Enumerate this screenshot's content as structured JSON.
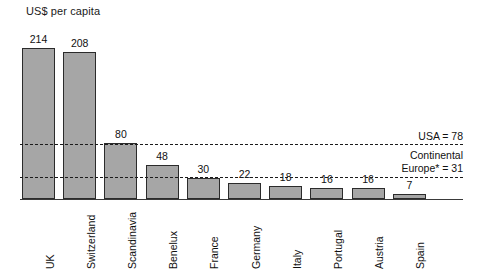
{
  "chart_data": {
    "type": "bar",
    "title": "US$ per capita",
    "xlabel": "",
    "ylabel": "",
    "ylim": [
      0,
      214
    ],
    "grid": false,
    "legend": "none",
    "categories": [
      "UK",
      "Switzerland",
      "Scandinavia",
      "Benelux",
      "France",
      "Germany",
      "Italy",
      "Portugal",
      "Austria",
      "Spain"
    ],
    "values": [
      214,
      208,
      80,
      48,
      30,
      22,
      18,
      16,
      16,
      7
    ],
    "value_labels": [
      "214",
      "208",
      "80",
      "48",
      "30",
      "22",
      "18",
      "16",
      "16",
      "7"
    ],
    "reference_lines": [
      {
        "label": "USA = 78",
        "label_line1": "USA = 78",
        "label_line2": "",
        "value": 78
      },
      {
        "label": "Continental Europe* = 31",
        "label_line1": "Continental",
        "label_line2": "Europe* = 31",
        "value": 31
      }
    ],
    "colors": {
      "bar_fill": "#a6a6a6",
      "bar_stroke": "#2b2b2b",
      "axis": "#3a3a3a",
      "text": "#111111",
      "background": "#ffffff"
    }
  }
}
